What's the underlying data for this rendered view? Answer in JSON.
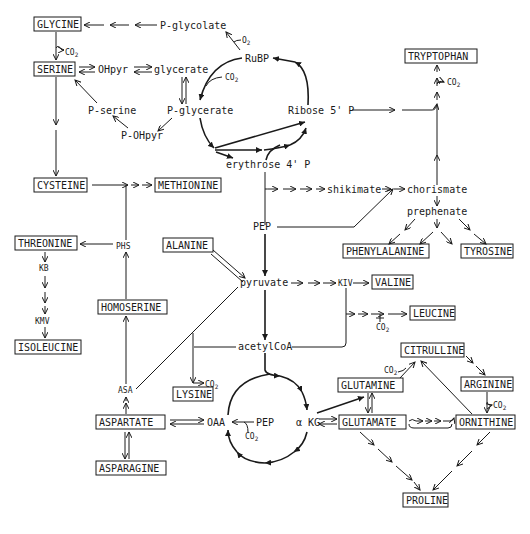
{
  "diagram": {
    "amino_acids": {
      "glycine": "GLYCINE",
      "serine": "SERINE",
      "cysteine": "CYSTEINE",
      "methionine": "METHIONINE",
      "threonine": "THREONINE",
      "isoleucine": "ISOLEUCINE",
      "homoserine": "HOMOSERINE",
      "alanine": "ALANINE",
      "lysine": "LYSINE",
      "aspartate": "ASPARTATE",
      "asparagine": "ASPARAGINE",
      "tryptophan": "TRYPTOPHAN",
      "phenylalanine": "PHENYLALANINE",
      "tyrosine": "TYROSINE",
      "valine": "VALINE",
      "leucine": "LEUCINE",
      "citrulline": "CITRULLINE",
      "arginine": "ARGININE",
      "glutamine": "GLUTAMINE",
      "glutamate": "GLUTAMATE",
      "ornithine": "ORNITHINE",
      "proline": "PROLINE"
    },
    "intermediates": {
      "p_glycolate": "P-glycolate",
      "o2": "O",
      "rubp": "RuBP",
      "ohpyr": "OHpyr",
      "glycerate": "glycerate",
      "p_serine": "P-serine",
      "p_glycerate": "P-glycerate",
      "p_ohpyr": "P-OHpyr",
      "ribose5p": "Ribose 5' P",
      "erythrose4p": "erythrose 4' P",
      "shikimate": "shikimate",
      "chorismate": "chorismate",
      "prephenate": "prephenate",
      "pep": "PEP",
      "phs": "PHS",
      "kb": "KB",
      "kmv": "KMV",
      "pyruvate": "pyruvate",
      "kiv": "KIV",
      "acetylcoa": "acetylCoA",
      "asa": "ASA",
      "oaa": "OAA",
      "pep2": "PEP",
      "akg": "α KG",
      "co2": "CO",
      "sub2": "2"
    }
  }
}
